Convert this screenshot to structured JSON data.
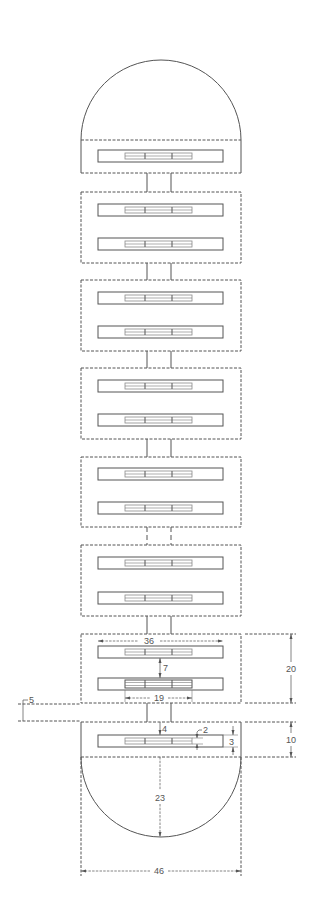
{
  "diagram": {
    "type": "technical-drawing",
    "colors": {
      "line": "#555555",
      "background": "#ffffff"
    },
    "modules": [
      {
        "index": 1,
        "bars": 1,
        "section": "top-cap-module"
      },
      {
        "index": 2,
        "bars": 2
      },
      {
        "index": 3,
        "bars": 2
      },
      {
        "index": 4,
        "bars": 2
      },
      {
        "index": 5,
        "bars": 2
      },
      {
        "index": 6,
        "bars": 2
      },
      {
        "index": 7,
        "bars": 2,
        "dimensioned": true
      },
      {
        "index": 8,
        "bars": 1,
        "section": "bottom-cap-module",
        "dimensioned": true
      }
    ],
    "dimensions": {
      "bar_length": "36",
      "bar_spacing": "7",
      "inner_strip_length": "19",
      "module_height": "20",
      "gap": "5",
      "connector_offset": "4",
      "strip_thickness": "2",
      "bar_height": "3",
      "end_module_height": "10",
      "dome_radius": "23",
      "overall_width": "46"
    }
  }
}
